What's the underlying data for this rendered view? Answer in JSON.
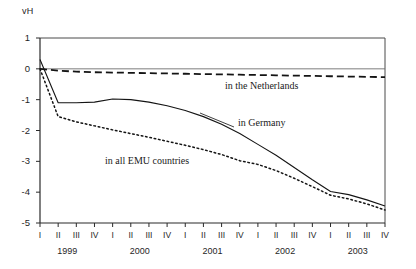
{
  "chart_data": {
    "type": "line",
    "title": "",
    "subtitle": "",
    "xlabel": "",
    "ylabel": "vH",
    "ylim": [
      -5,
      1
    ],
    "xlim": [
      0,
      19
    ],
    "grid": false,
    "legend_position": "inline-annotations",
    "y_ticks": [
      1,
      0,
      -1,
      -2,
      -3,
      -4,
      -5
    ],
    "y_tick_labels": [
      "1",
      "0",
      "-1",
      "-2",
      "-3",
      "-4",
      "-5"
    ],
    "x": [
      "1999-I",
      "1999-II",
      "1999-III",
      "1999-IV",
      "2000-I",
      "2000-II",
      "2000-III",
      "2000-IV",
      "2001-I",
      "2001-II",
      "2001-III",
      "2001-IV",
      "2002-I",
      "2002-II",
      "2002-III",
      "2002-IV",
      "2003-I",
      "2003-II",
      "2003-III",
      "2003-IV"
    ],
    "quarter_tick_labels": [
      "I",
      "II",
      "III",
      "IV",
      "I",
      "II",
      "III",
      "IV",
      "I",
      "II",
      "III",
      "IV",
      "I",
      "II",
      "III",
      "IV",
      "I",
      "II",
      "III",
      "IV"
    ],
    "year_labels": [
      "1999",
      "2000",
      "2001",
      "2002",
      "2003"
    ],
    "series": [
      {
        "name": "in the Netherlands",
        "style": "dashed",
        "color": "#141414",
        "annotation": "in the Netherlands",
        "values": [
          0.0,
          -0.06,
          -0.09,
          -0.11,
          -0.12,
          -0.13,
          -0.14,
          -0.15,
          -0.16,
          -0.17,
          -0.18,
          -0.19,
          -0.2,
          -0.21,
          -0.22,
          -0.23,
          -0.24,
          -0.25,
          -0.26,
          -0.27
        ]
      },
      {
        "name": "in Germany",
        "style": "solid",
        "color": "#141414",
        "annotation": "in Germany",
        "values": [
          0.3,
          -1.1,
          -1.1,
          -1.08,
          -0.98,
          -1.0,
          -1.08,
          -1.2,
          -1.35,
          -1.55,
          -1.8,
          -2.1,
          -2.45,
          -2.8,
          -3.2,
          -3.6,
          -3.98,
          -4.08,
          -4.25,
          -4.45
        ]
      },
      {
        "name": "in all EMU countries",
        "style": "dotted",
        "color": "#141414",
        "annotation": "in all EMU countries",
        "values": [
          0.0,
          -1.55,
          -1.72,
          -1.85,
          -1.98,
          -2.1,
          -2.22,
          -2.35,
          -2.48,
          -2.62,
          -2.78,
          -2.98,
          -3.1,
          -3.3,
          -3.55,
          -3.82,
          -4.1,
          -4.22,
          -4.38,
          -4.58
        ]
      }
    ]
  },
  "axis": {
    "unit_label": "vH"
  },
  "annotations": {
    "netherlands": "in the Netherlands",
    "germany": "in Germany",
    "emu": "in all EMU countries"
  }
}
